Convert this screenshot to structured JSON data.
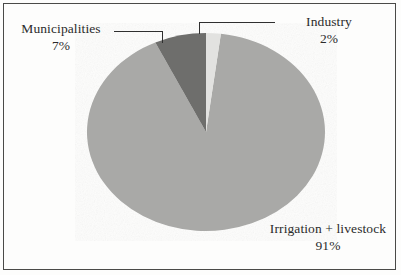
{
  "chart_data": {
    "type": "pie",
    "title": "",
    "subtitle": "",
    "xlabel": "",
    "ylabel": "",
    "legend_position": "none",
    "grid": false,
    "categories": [
      "Industry",
      "Irrigation + livestock",
      "Municipalities"
    ],
    "values": [
      2,
      91,
      7
    ],
    "unit": "%",
    "slices": [
      {
        "label": "Industry",
        "value": 2,
        "value_text": "2%",
        "color": "#e2e2e0",
        "label_position": "top-right",
        "leader_line": true
      },
      {
        "label": "Irrigation + livestock",
        "value": 91,
        "value_text": "91%",
        "color": "#a9a9a7",
        "label_position": "bottom-right",
        "leader_line": false
      },
      {
        "label": "Municipalities",
        "value": 7,
        "value_text": "7%",
        "color": "#6e6e6c",
        "label_position": "top-left",
        "leader_line": true
      }
    ],
    "start_angle_deg": 0,
    "direction": "clockwise",
    "annotations": []
  },
  "labels": {
    "municipalities": {
      "name": "Municipalities",
      "percent": "7%"
    },
    "industry": {
      "name": "Industry",
      "percent": "2%"
    },
    "irrigation": {
      "name": "Irrigation + livestock",
      "percent": "91%"
    }
  },
  "colors": {
    "industry": "#e2e2e0",
    "irrigation": "#a9a9a7",
    "municipalities": "#6e6e6c",
    "frame": "#4a4a48",
    "text": "#2b2b2b",
    "background": "#fdfdfc"
  },
  "geometry": {
    "center_x": 206,
    "center_y": 132,
    "radius_x": 119,
    "radius_y": 99
  }
}
